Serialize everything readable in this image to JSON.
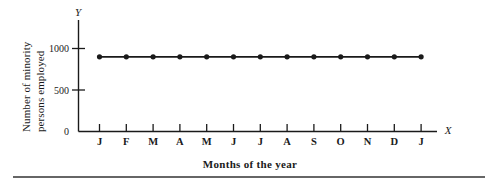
{
  "figure": {
    "background_color": "#ffffff",
    "ink_color": "#1a1a1a",
    "bottom_rule_color": "#333333",
    "axis_letters": {
      "y": "Y",
      "x": "X"
    },
    "y_axis_title_line1": "Number of minority",
    "y_axis_title_line2": "persons employed",
    "caption": "Months of the year"
  },
  "chart_data": {
    "type": "line",
    "title": "",
    "subtitle": "",
    "xlabel": "Months of the year",
    "ylabel": "Number of minority persons employed",
    "categories": [
      "J",
      "F",
      "M",
      "A",
      "M",
      "J",
      "J",
      "A",
      "S",
      "O",
      "N",
      "D",
      "J"
    ],
    "category_full_names": [
      "January",
      "February",
      "March",
      "April",
      "May",
      "June",
      "July",
      "August",
      "September",
      "October",
      "November",
      "December",
      "January"
    ],
    "values": [
      900,
      900,
      900,
      900,
      900,
      900,
      900,
      900,
      900,
      900,
      900,
      900,
      900
    ],
    "series": [
      {
        "name": "Number of minority persons employed",
        "values": [
          900,
          900,
          900,
          900,
          900,
          900,
          900,
          900,
          900,
          900,
          900,
          900,
          900
        ],
        "marker": "filled-circle",
        "line_style": "solid",
        "color": "#1a1a1a"
      }
    ],
    "ylim": [
      0,
      1100
    ],
    "ytick_values": [
      0,
      500,
      1000
    ],
    "ytick_labels": [
      "0",
      "500",
      "1000"
    ],
    "xlim_categories": [
      0,
      12
    ],
    "grid": false,
    "legend": false,
    "legend_position": "none",
    "annotations": []
  }
}
